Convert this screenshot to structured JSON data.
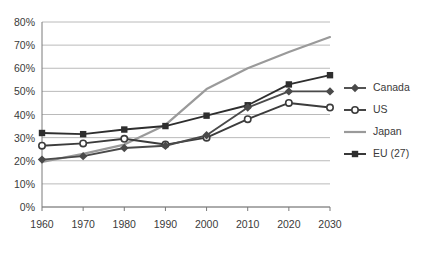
{
  "chart_data": {
    "type": "line",
    "title": "",
    "subtitle": "",
    "xlabel": "",
    "ylabel": "",
    "x": [
      1960,
      1970,
      1980,
      1990,
      2000,
      2010,
      2020,
      2030
    ],
    "categories": [
      "1960",
      "1970",
      "1980",
      "1990",
      "2000",
      "2010",
      "2020",
      "2030"
    ],
    "xtick_labels": [
      "1960",
      "1970",
      "1980",
      "1990",
      "2000",
      "2010",
      "2020",
      "2030"
    ],
    "ytick_labels": [
      "0%",
      "10%",
      "20%",
      "30%",
      "40%",
      "50%",
      "60%",
      "70%",
      "80%"
    ],
    "ytick_values": [
      0,
      10,
      20,
      30,
      40,
      50,
      60,
      70,
      80
    ],
    "ylim": [
      0,
      80
    ],
    "xlim": [
      1960,
      2030
    ],
    "grid": "horizontal",
    "legend_position": "right",
    "series": [
      {
        "name": "Canada",
        "values": [
          20.5,
          22,
          25.5,
          26.5,
          31,
          43,
          50,
          50
        ],
        "color": "#4a4a4a",
        "marker": "diamond"
      },
      {
        "name": "US",
        "values": [
          26.5,
          27.5,
          29.5,
          27,
          30,
          38,
          45,
          43
        ],
        "color": "#3c3c3c",
        "marker": "circle-open"
      },
      {
        "name": "Japan",
        "values": [
          19.5,
          23,
          27,
          35.5,
          51,
          60,
          67,
          73.5
        ],
        "color": "#9a9a9a",
        "marker": "none"
      },
      {
        "name": "EU (27)",
        "values": [
          32,
          31.5,
          33.5,
          35,
          39.5,
          44,
          53,
          57
        ],
        "color": "#2e2e2e",
        "marker": "square"
      }
    ]
  },
  "legend": {
    "entries": [
      {
        "label": "Canada"
      },
      {
        "label": "US"
      },
      {
        "label": "Japan"
      },
      {
        "label": "EU (27)"
      }
    ]
  },
  "colors": {
    "background": "#ffffff",
    "grid": "#a8a8a8",
    "axis": "#7a7a7a",
    "text": "#3a3a3a"
  }
}
